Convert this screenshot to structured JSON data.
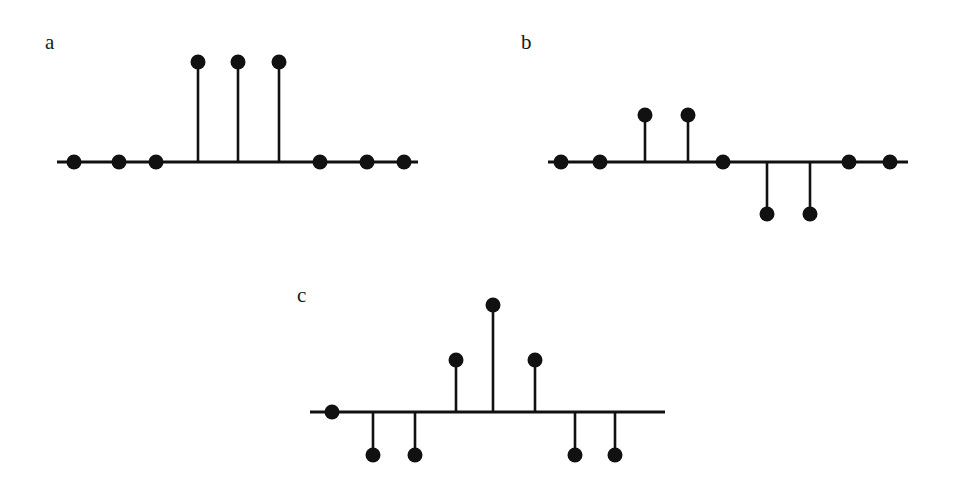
{
  "figure": {
    "width": 967,
    "height": 491,
    "background": "#ffffff",
    "ink_color": "#111111",
    "label_color": "#1a1a1a",
    "type": "stem-plot-figure",
    "panel_count": 3
  },
  "panels": [
    {
      "id": "panel-a",
      "label": "a",
      "label_x": 45,
      "label_y": 32,
      "baseline_y": 162,
      "axis_x_start": 57,
      "axis_x_end": 418,
      "dot_radius": 7.5,
      "samples": [
        {
          "x": 74,
          "value": 0,
          "tip_y": 162
        },
        {
          "x": 119,
          "value": 0,
          "tip_y": 162
        },
        {
          "x": 156,
          "value": 0,
          "tip_y": 162
        },
        {
          "x": 198,
          "value": 1,
          "tip_y": 62
        },
        {
          "x": 238,
          "value": 1,
          "tip_y": 62
        },
        {
          "x": 279,
          "value": 1,
          "tip_y": 62
        },
        {
          "x": 320,
          "value": 0,
          "tip_y": 162
        },
        {
          "x": 367,
          "value": 0,
          "tip_y": 162
        },
        {
          "x": 404,
          "value": 0,
          "tip_y": 162
        }
      ]
    },
    {
      "id": "panel-b",
      "label": "b",
      "label_x": 521,
      "label_y": 32,
      "baseline_y": 162,
      "axis_x_start": 548,
      "axis_x_end": 908,
      "dot_radius": 7.5,
      "samples": [
        {
          "x": 561,
          "value": 0,
          "tip_y": 162
        },
        {
          "x": 600,
          "value": 0,
          "tip_y": 162
        },
        {
          "x": 645,
          "value": 1,
          "tip_y": 115
        },
        {
          "x": 688,
          "value": 1,
          "tip_y": 115
        },
        {
          "x": 723,
          "value": 0,
          "tip_y": 162
        },
        {
          "x": 767,
          "value": -1,
          "tip_y": 214
        },
        {
          "x": 810,
          "value": -1,
          "tip_y": 214
        },
        {
          "x": 849,
          "value": 0,
          "tip_y": 162
        },
        {
          "x": 890,
          "value": 0,
          "tip_y": 162
        }
      ]
    },
    {
      "id": "panel-c",
      "label": "c",
      "label_x": 297,
      "label_y": 285,
      "baseline_y": 412,
      "axis_x_start": 310,
      "axis_x_end": 665,
      "dot_radius": 7.5,
      "samples": [
        {
          "x": 332,
          "value": 0,
          "tip_y": 412
        },
        {
          "x": 373,
          "value": -1,
          "tip_y": 455
        },
        {
          "x": 415,
          "value": -1,
          "tip_y": 455
        },
        {
          "x": 456,
          "value": 1,
          "tip_y": 360
        },
        {
          "x": 493,
          "value": 2,
          "tip_y": 305
        },
        {
          "x": 535,
          "value": 1,
          "tip_y": 360
        },
        {
          "x": 575,
          "value": -1,
          "tip_y": 455
        },
        {
          "x": 615,
          "value": -1,
          "tip_y": 455
        }
      ]
    }
  ],
  "chart_data": {
    "type": "scatter",
    "title": "",
    "xlabel": "",
    "ylabel": "",
    "subplots": [
      {
        "label": "a",
        "type": "scatter",
        "x": [
          0,
          1,
          2,
          3,
          4,
          5,
          6,
          7,
          8
        ],
        "values": [
          0,
          0,
          0,
          1,
          1,
          1,
          0,
          0,
          0
        ],
        "ylim": [
          -1,
          2
        ],
        "grid": false,
        "legend": "none"
      },
      {
        "label": "b",
        "type": "scatter",
        "x": [
          0,
          1,
          2,
          3,
          4,
          5,
          6,
          7,
          8
        ],
        "values": [
          0,
          0,
          1,
          1,
          0,
          -1,
          -1,
          0,
          0
        ],
        "ylim": [
          -1,
          2
        ],
        "grid": false,
        "legend": "none"
      },
      {
        "label": "c",
        "type": "scatter",
        "x": [
          0,
          1,
          2,
          3,
          4,
          5,
          6,
          7
        ],
        "values": [
          0,
          -1,
          -1,
          1,
          2,
          1,
          -1,
          -1
        ],
        "ylim": [
          -1,
          2
        ],
        "grid": false,
        "legend": "none"
      }
    ]
  }
}
